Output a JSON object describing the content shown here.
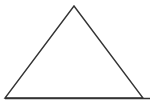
{
  "diagram": {
    "shape": "triangle",
    "stroke_color": "#333333",
    "fill_color": "#ffffff",
    "stroke_width": 1.4,
    "vertices": {
      "apex": {
        "x": 74,
        "y": 6
      },
      "bottom_left": {
        "x": 5,
        "y": 98
      },
      "bottom_right": {
        "x": 143,
        "y": 98
      }
    },
    "base_extension": {
      "x1": 5,
      "y1": 98.5,
      "x2": 150,
      "y2": 98.5
    }
  }
}
